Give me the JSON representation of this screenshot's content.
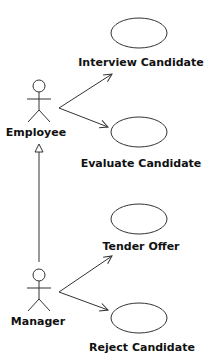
{
  "diagram": {
    "type": "uml-use-case",
    "actors": [
      {
        "id": "employee",
        "label": "Employee"
      },
      {
        "id": "manager",
        "label": "Manager"
      }
    ],
    "use_cases": [
      {
        "id": "interview",
        "label": "Interview Candidate"
      },
      {
        "id": "evaluate",
        "label": "Evaluate Candidate"
      },
      {
        "id": "tender",
        "label": "Tender Offer"
      },
      {
        "id": "reject",
        "label": "Reject Candidate"
      }
    ],
    "associations": [
      {
        "from": "employee",
        "to": "interview"
      },
      {
        "from": "employee",
        "to": "evaluate"
      },
      {
        "from": "manager",
        "to": "tender"
      },
      {
        "from": "manager",
        "to": "reject"
      }
    ],
    "generalizations": [
      {
        "child": "manager",
        "parent": "employee"
      }
    ],
    "colors": {
      "line": "#333333",
      "text": "#111111",
      "background": "#ffffff"
    }
  }
}
